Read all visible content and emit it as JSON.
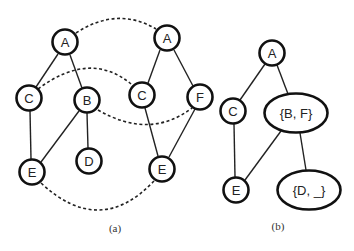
{
  "figure": {
    "panel_a": {
      "caption": "(a)",
      "graph1": {
        "nodes": [
          {
            "id": "A",
            "label": "A"
          },
          {
            "id": "C",
            "label": "C"
          },
          {
            "id": "B",
            "label": "B"
          },
          {
            "id": "E",
            "label": "E"
          },
          {
            "id": "D",
            "label": "D"
          }
        ],
        "edges": [
          [
            "A",
            "C"
          ],
          [
            "A",
            "B"
          ],
          [
            "C",
            "E"
          ],
          [
            "B",
            "E"
          ],
          [
            "B",
            "D"
          ]
        ]
      },
      "graph2": {
        "nodes": [
          {
            "id": "A",
            "label": "A"
          },
          {
            "id": "C",
            "label": "C"
          },
          {
            "id": "F",
            "label": "F"
          },
          {
            "id": "E",
            "label": "E"
          }
        ],
        "edges": [
          [
            "A",
            "C"
          ],
          [
            "A",
            "F"
          ],
          [
            "C",
            "E"
          ],
          [
            "F",
            "E"
          ]
        ]
      },
      "correspondences": [
        [
          "A",
          "A"
        ],
        [
          "C",
          "C"
        ],
        [
          "B",
          "F"
        ],
        [
          "E",
          "E"
        ]
      ]
    },
    "panel_b": {
      "caption": "(b)",
      "nodes": [
        {
          "id": "A",
          "label": "A"
        },
        {
          "id": "C",
          "label": "C"
        },
        {
          "id": "BF",
          "label": "{B, F}"
        },
        {
          "id": "E",
          "label": "E"
        },
        {
          "id": "D_",
          "label": "{D, _}"
        }
      ],
      "edges": [
        [
          "A",
          "C"
        ],
        [
          "A",
          "BF"
        ],
        [
          "C",
          "E"
        ],
        [
          "BF",
          "E"
        ],
        [
          "BF",
          "D_"
        ]
      ]
    }
  }
}
